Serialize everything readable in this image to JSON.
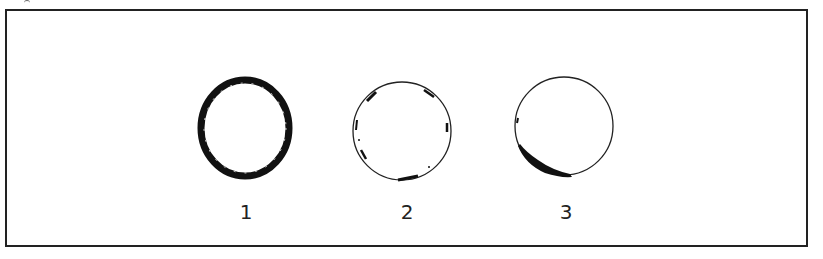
{
  "figure": {
    "panels": [
      {
        "label": "1",
        "description": "thick dark ring all around"
      },
      {
        "label": "2",
        "description": "thin circle with scattered marks at edge"
      },
      {
        "label": "3",
        "description": "thin circle with dark crescent at lower left"
      }
    ]
  }
}
